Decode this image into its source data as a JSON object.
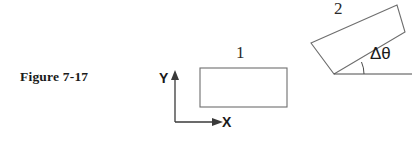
{
  "figure": {
    "caption": "Figure 7-17",
    "background_color": "#ffffff",
    "stroke_color": "#6e6e6e",
    "axis_color": "#3a3a3a",
    "text_color": "#1a1a1a",
    "width": 415,
    "height": 145
  },
  "labels": {
    "rect_1": "1",
    "rect_2": "2",
    "axis_x": "X",
    "axis_y": "Y",
    "angle": "Δθ"
  },
  "geometry": {
    "rect_1": {
      "name": "rectangle-1-unrotated",
      "x": 200,
      "y": 68,
      "width": 87,
      "height": 39,
      "rotation_deg": 0
    },
    "rect_2": {
      "name": "rectangle-2-rotated",
      "corners": [
        [
          311,
          43
        ],
        [
          397,
          5
        ],
        [
          405,
          32
        ],
        [
          334,
          74
        ]
      ],
      "rotation_deg": -23.8
    },
    "axes": {
      "origin": [
        175,
        122
      ],
      "y_tip": [
        175,
        71
      ],
      "x_tip": [
        224,
        122
      ]
    },
    "reference_line": {
      "from": [
        334,
        74
      ],
      "to": [
        412,
        74
      ]
    },
    "angle_arc": {
      "vertex": [
        334,
        74
      ],
      "radius": 30,
      "start_deg": 0,
      "end_deg": -23.8
    }
  }
}
